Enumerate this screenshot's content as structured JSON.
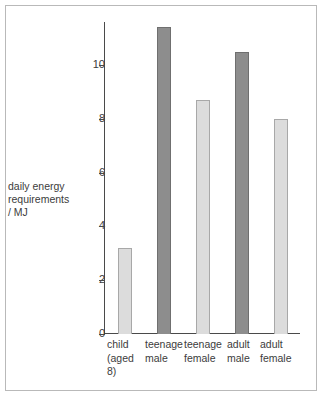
{
  "chart_data": {
    "type": "bar",
    "title": "",
    "xlabel": "",
    "ylabel": "daily energy requirements / MJ",
    "ylabel_lines": [
      "daily energy",
      "requirements",
      "/ MJ"
    ],
    "ylim": [
      0,
      11.6
    ],
    "yticks": [
      0,
      2,
      4,
      6,
      8,
      10
    ],
    "ytick_labels": [
      "0",
      "2",
      "4",
      "6",
      "8",
      "10"
    ],
    "grid": false,
    "legend": "none",
    "categories": [
      "child (aged 8)",
      "teenage male",
      "teenage female",
      "adult male",
      "adult female"
    ],
    "category_lines": [
      [
        "child",
        "(aged",
        "8)"
      ],
      [
        "teenage",
        "male"
      ],
      [
        "teenage",
        "female"
      ],
      [
        "adult",
        "male"
      ],
      [
        "adult",
        "female"
      ]
    ],
    "values": [
      3.2,
      11.4,
      8.7,
      10.5,
      8.0
    ],
    "series": [
      {
        "name": "daily energy requirements / MJ",
        "values": [
          3.2,
          11.4,
          8.7,
          10.5,
          8.0
        ]
      }
    ],
    "bar_styles": [
      "light",
      "dark",
      "light",
      "dark",
      "light"
    ],
    "colors": {
      "light_fill": "#dcdcdc",
      "light_border": "#a8a8a8",
      "dark_fill": "#8d8d8d",
      "dark_border": "#6f6f6f",
      "axis": "#4a4a4a",
      "text": "#3c3c3c",
      "frame_border": "#b9b9b9",
      "background": "#ffffff"
    }
  }
}
